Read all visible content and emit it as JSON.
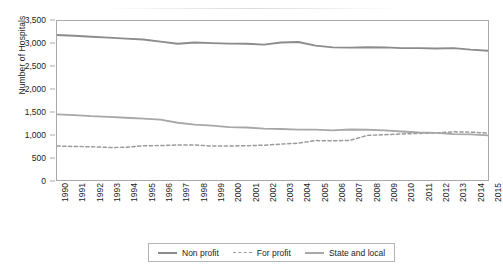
{
  "chart_data": {
    "type": "line",
    "title": "",
    "xlabel": "",
    "ylabel": "Number of Hospitals",
    "ylim": [
      0,
      3500
    ],
    "ytick_step": 500,
    "yticks": [
      "0",
      "500",
      "1,000",
      "1,500",
      "2,000",
      "2,500",
      "3,000",
      "3,500"
    ],
    "grid": false,
    "legend_position": "bottom",
    "categories": [
      "1990",
      "1991",
      "1992",
      "1993",
      "1994",
      "1995",
      "1996",
      "1997",
      "1998",
      "1999",
      "2000",
      "2001",
      "2002",
      "2003",
      "2004",
      "2005",
      "2006",
      "2007",
      "2008",
      "2009",
      "2010",
      "2011",
      "2012",
      "2013",
      "2014",
      "2015"
    ],
    "series": [
      {
        "name": "Non profit",
        "color": "#8c8c8c",
        "style": "solid",
        "values": [
          3191,
          3175,
          3154,
          3133,
          3111,
          3092,
          3045,
          3000,
          3026,
          3012,
          3003,
          2998,
          2980,
          3026,
          3038,
          2958,
          2919,
          2913,
          2923,
          2918,
          2904,
          2903,
          2894,
          2904,
          2870,
          2845
        ]
      },
      {
        "name": "For profit",
        "color": "#9a9a9a",
        "style": "dashed",
        "values": [
          749,
          738,
          732,
          717,
          719,
          752,
          759,
          771,
          771,
          747,
          749,
          754,
          766,
          790,
          812,
          868,
          861,
          873,
          982,
          998,
          1013,
          1025,
          1037,
          1060,
          1053,
          1034
        ]
      },
      {
        "name": "State and local",
        "color": "#a8a8a8",
        "style": "solid",
        "values": [
          1444,
          1429,
          1405,
          1390,
          1370,
          1350,
          1329,
          1260,
          1218,
          1197,
          1163,
          1156,
          1130,
          1123,
          1110,
          1110,
          1092,
          1111,
          1105,
          1092,
          1068,
          1045,
          1037,
          1010,
          1003,
          983
        ]
      }
    ]
  },
  "legend": {
    "items": [
      {
        "label": "Non profit"
      },
      {
        "label": "For profit"
      },
      {
        "label": "State and local"
      }
    ]
  }
}
